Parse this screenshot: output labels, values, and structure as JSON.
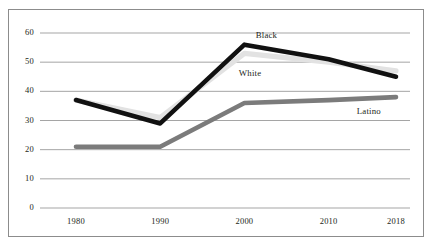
{
  "chart_data": {
    "type": "line",
    "title": "",
    "subtitle": "",
    "xlabel": "",
    "ylabel": "",
    "categories": [
      "1980",
      "1990",
      "2000",
      "2010",
      "2018"
    ],
    "x": [
      1980,
      1990,
      2000,
      2010,
      2018
    ],
    "xlim": [
      1980,
      2018
    ],
    "ylim": [
      0,
      60
    ],
    "yticks": [
      0,
      10,
      20,
      30,
      40,
      50,
      60
    ],
    "ytick_labels": [
      "0",
      "10",
      "20",
      "30",
      "40",
      "50",
      "60"
    ],
    "xtick_labels": [
      "1980",
      "1990",
      "2000",
      "2010",
      "2018"
    ],
    "grid": "horizontal",
    "legend": "inline-labels",
    "series": [
      {
        "name": "Black",
        "color": "#111111",
        "values": [
          37,
          29,
          56,
          51,
          45
        ],
        "label_text": "Black"
      },
      {
        "name": "White",
        "color": "#e2e2e2",
        "values": [
          37,
          31,
          53,
          50,
          47
        ],
        "label_text": "White"
      },
      {
        "name": "Latino",
        "color": "#7b7b7b",
        "values": [
          21,
          21,
          36,
          37,
          38
        ],
        "label_text": "Latino"
      }
    ],
    "annotations": [
      {
        "text": "Black",
        "x": 2003,
        "y": 59
      },
      {
        "text": "White",
        "x": 2001,
        "y": 46
      },
      {
        "text": "Latino",
        "x": 2015,
        "y": 33
      }
    ]
  },
  "frame": {
    "border_color": "#8c8c8c",
    "grid_color": "#9b9b9b",
    "background": "#ffffff"
  }
}
